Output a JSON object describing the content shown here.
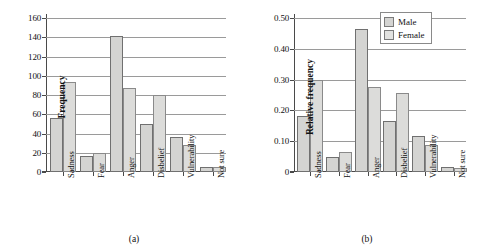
{
  "figure": {
    "legend": {
      "position": "top-right-of-panel-b",
      "entries": [
        {
          "label": "Male",
          "key": "male",
          "color": "#d4d4d2"
        },
        {
          "label": "Female",
          "key": "female",
          "color": "#e2e2e0"
        }
      ]
    }
  },
  "chart_data": [
    {
      "type": "bar",
      "panel_caption": "(a)",
      "title": "",
      "xlabel": "",
      "ylabel": "Frequency",
      "ylim": [
        0,
        160
      ],
      "yticks": [
        0,
        20,
        40,
        60,
        80,
        100,
        120,
        140,
        160
      ],
      "ytick_labels": [
        "0",
        "20",
        "40",
        "60",
        "80",
        "100",
        "120",
        "140",
        "160"
      ],
      "grid": true,
      "legend_position": "none",
      "categories": [
        "Sadness",
        "Fear",
        "Anger",
        "Disbelief",
        "Vulnerability",
        "Not sure"
      ],
      "series": [
        {
          "name": "Male",
          "values": [
            56,
            17,
            141,
            50,
            36,
            5
          ]
        },
        {
          "name": "Female",
          "values": [
            94,
            20,
            87,
            80,
            28,
            5
          ]
        }
      ]
    },
    {
      "type": "bar",
      "panel_caption": "(b)",
      "title": "",
      "xlabel": "",
      "ylabel": "Relative frequency",
      "ylim": [
        0,
        0.5
      ],
      "yticks": [
        0,
        0.1,
        0.2,
        0.3,
        0.4,
        0.5
      ],
      "ytick_labels": [
        "0",
        "0.10",
        "0.20",
        "0.30",
        "0.40",
        "0.50"
      ],
      "grid": true,
      "legend_position": "top-right",
      "categories": [
        "Sadness",
        "Fear",
        "Anger",
        "Disbelief",
        "Vulnerability",
        "Not sure"
      ],
      "series": [
        {
          "name": "Male",
          "values": [
            0.183,
            0.048,
            0.463,
            0.165,
            0.117,
            0.015
          ]
        },
        {
          "name": "Female",
          "values": [
            0.3,
            0.065,
            0.275,
            0.255,
            0.087,
            0.012
          ]
        }
      ]
    }
  ]
}
